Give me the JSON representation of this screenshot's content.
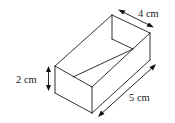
{
  "diagram": {
    "type": "open rectangular box (cuboid) with dimensions",
    "labels": {
      "width": "4 cm",
      "height": "2 cm",
      "length": "5 cm"
    },
    "colors": {
      "line": "#1a1a1a",
      "text": "#222222",
      "background": "#ffffff"
    }
  }
}
